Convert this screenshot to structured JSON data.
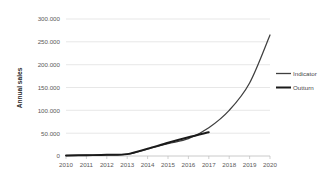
{
  "chart_data": {
    "type": "line",
    "title": "",
    "xlabel": "",
    "ylabel": "Annual sales",
    "x": [
      2010,
      2011,
      2012,
      2013,
      2014,
      2015,
      2016,
      2017,
      2018,
      2019,
      2020
    ],
    "xticklabels": [
      "2010",
      "2011",
      "2012",
      "2013",
      "2014",
      "2015",
      "2016",
      "2017",
      "2018",
      "2019",
      "2020"
    ],
    "yticks": [
      0,
      50000,
      100000,
      150000,
      200000,
      250000,
      300000
    ],
    "yticklabels": [
      "0",
      "50.000",
      "100.000",
      "150.000",
      "200.000",
      "250.000",
      "300.000"
    ],
    "ylim": [
      0,
      300000
    ],
    "xlim": [
      2010,
      2020
    ],
    "grid": true,
    "legend_position": "right",
    "series": [
      {
        "name": "Indicator",
        "color": "#3f3f3f",
        "x": [
          2010,
          2011,
          2012,
          2013,
          2014,
          2015,
          2016,
          2017,
          2018,
          2019,
          2020
        ],
        "values": [
          1000,
          1800,
          2600,
          4000,
          15000,
          27000,
          38000,
          62000,
          100000,
          160000,
          265000
        ]
      },
      {
        "name": "Outturn",
        "color": "#1a1a1a",
        "x": [
          2010,
          2011,
          2012,
          2013,
          2014,
          2015,
          2016,
          2017
        ],
        "values": [
          1000,
          1800,
          2600,
          4200,
          16000,
          29000,
          41000,
          52000
        ]
      }
    ]
  },
  "legend": {
    "items": [
      {
        "label": "Indicator"
      },
      {
        "label": "Outturn"
      }
    ]
  },
  "axes": {
    "y_title": "Annual sales"
  }
}
